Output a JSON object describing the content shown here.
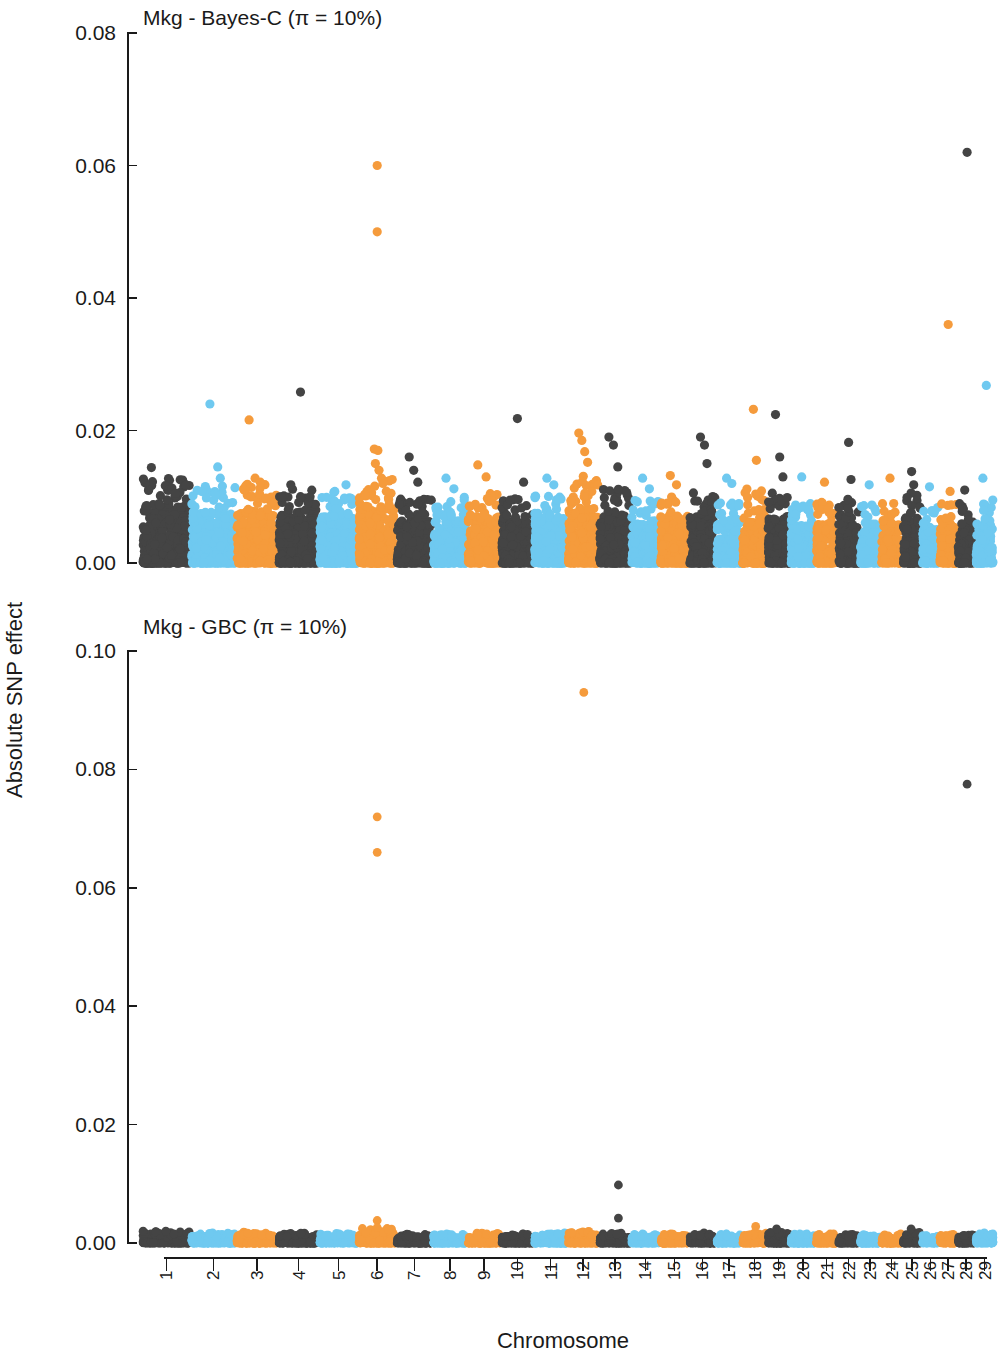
{
  "figure": {
    "width": 999,
    "height": 1357,
    "background": "#ffffff"
  },
  "axes": {
    "x_title": "Chromosome",
    "y_title": "Absolute SNP effect"
  },
  "colors": {
    "dark": "#444444",
    "blue": "#6FC9F0",
    "orange": "#F59B3C",
    "axis": "#1a1a1a",
    "background": "#ffffff"
  },
  "chart_data": [
    {
      "type": "scatter",
      "panel": "top",
      "title": "Mkg - Bayes-C (π = 10%)",
      "xlabel": "Chromosome",
      "ylabel": "Absolute SNP effect",
      "ylim": [
        0,
        0.08
      ],
      "yticks": [
        0.0,
        0.02,
        0.04,
        0.06,
        0.08
      ],
      "ytick_labels": [
        "0.00",
        "0.02",
        "0.04",
        "0.06",
        "0.08"
      ],
      "grid": false,
      "legend": "none",
      "categories": [
        "1",
        "2",
        "3",
        "4",
        "5",
        "6",
        "7",
        "8",
        "9",
        "10",
        "11",
        "12",
        "13",
        "14",
        "15",
        "16",
        "17",
        "18",
        "19",
        "20",
        "21",
        "22",
        "23",
        "24",
        "25",
        "26",
        "27",
        "28",
        "29"
      ],
      "chromosome_widths": [
        100,
        93,
        86,
        83,
        80,
        77,
        74,
        70,
        68,
        66,
        68,
        63,
        64,
        58,
        58,
        54,
        51,
        50,
        45,
        50,
        43,
        43,
        41,
        42,
        37,
        33,
        35,
        34,
        36
      ],
      "chromosome_baseline_max": [
        0.0085,
        0.0075,
        0.0078,
        0.0072,
        0.007,
        0.0082,
        0.0065,
        0.0065,
        0.0068,
        0.0063,
        0.0068,
        0.0085,
        0.0072,
        0.0062,
        0.0065,
        0.007,
        0.006,
        0.0072,
        0.0068,
        0.0058,
        0.006,
        0.0062,
        0.0058,
        0.006,
        0.007,
        0.0055,
        0.0058,
        0.0058,
        0.0062
      ],
      "outliers": [
        {
          "chrom": 1,
          "pos": 0.18,
          "value": 0.0144
        },
        {
          "chrom": 1,
          "pos": 0.55,
          "value": 0.011
        },
        {
          "chrom": 1,
          "pos": 0.62,
          "value": 0.0113
        },
        {
          "chrom": 1,
          "pos": 0.7,
          "value": 0.0105
        },
        {
          "chrom": 2,
          "pos": 0.42,
          "value": 0.024
        },
        {
          "chrom": 2,
          "pos": 0.6,
          "value": 0.0145
        },
        {
          "chrom": 2,
          "pos": 0.66,
          "value": 0.0128
        },
        {
          "chrom": 3,
          "pos": 0.3,
          "value": 0.0216
        },
        {
          "chrom": 3,
          "pos": 0.45,
          "value": 0.0128
        },
        {
          "chrom": 3,
          "pos": 0.58,
          "value": 0.0122
        },
        {
          "chrom": 3,
          "pos": 0.72,
          "value": 0.0098
        },
        {
          "chrom": 4,
          "pos": 0.3,
          "value": 0.0118
        },
        {
          "chrom": 4,
          "pos": 0.55,
          "value": 0.0258
        },
        {
          "chrom": 4,
          "pos": 0.8,
          "value": 0.01
        },
        {
          "chrom": 5,
          "pos": 0.4,
          "value": 0.0108
        },
        {
          "chrom": 5,
          "pos": 0.7,
          "value": 0.0118
        },
        {
          "chrom": 6,
          "pos": 0.5,
          "value": 0.06
        },
        {
          "chrom": 6,
          "pos": 0.5,
          "value": 0.05
        },
        {
          "chrom": 6,
          "pos": 0.42,
          "value": 0.0172
        },
        {
          "chrom": 6,
          "pos": 0.52,
          "value": 0.017
        },
        {
          "chrom": 6,
          "pos": 0.45,
          "value": 0.015
        },
        {
          "chrom": 6,
          "pos": 0.55,
          "value": 0.014
        },
        {
          "chrom": 6,
          "pos": 0.62,
          "value": 0.0128
        },
        {
          "chrom": 6,
          "pos": 0.66,
          "value": 0.012
        },
        {
          "chrom": 7,
          "pos": 0.35,
          "value": 0.016
        },
        {
          "chrom": 7,
          "pos": 0.48,
          "value": 0.014
        },
        {
          "chrom": 7,
          "pos": 0.6,
          "value": 0.0122
        },
        {
          "chrom": 8,
          "pos": 0.38,
          "value": 0.0128
        },
        {
          "chrom": 8,
          "pos": 0.62,
          "value": 0.0112
        },
        {
          "chrom": 9,
          "pos": 0.3,
          "value": 0.0148
        },
        {
          "chrom": 9,
          "pos": 0.56,
          "value": 0.013
        },
        {
          "chrom": 10,
          "pos": 0.5,
          "value": 0.0218
        },
        {
          "chrom": 10,
          "pos": 0.7,
          "value": 0.0122
        },
        {
          "chrom": 11,
          "pos": 0.38,
          "value": 0.0128
        },
        {
          "chrom": 11,
          "pos": 0.6,
          "value": 0.0118
        },
        {
          "chrom": 12,
          "pos": 0.35,
          "value": 0.0196
        },
        {
          "chrom": 12,
          "pos": 0.45,
          "value": 0.0185
        },
        {
          "chrom": 12,
          "pos": 0.55,
          "value": 0.0168
        },
        {
          "chrom": 12,
          "pos": 0.65,
          "value": 0.0152
        },
        {
          "chrom": 13,
          "pos": 0.3,
          "value": 0.019
        },
        {
          "chrom": 13,
          "pos": 0.45,
          "value": 0.0178
        },
        {
          "chrom": 13,
          "pos": 0.6,
          "value": 0.0145
        },
        {
          "chrom": 14,
          "pos": 0.4,
          "value": 0.0128
        },
        {
          "chrom": 14,
          "pos": 0.65,
          "value": 0.0112
        },
        {
          "chrom": 15,
          "pos": 0.35,
          "value": 0.0132
        },
        {
          "chrom": 15,
          "pos": 0.58,
          "value": 0.0118
        },
        {
          "chrom": 16,
          "pos": 0.42,
          "value": 0.019
        },
        {
          "chrom": 16,
          "pos": 0.58,
          "value": 0.0178
        },
        {
          "chrom": 16,
          "pos": 0.68,
          "value": 0.015
        },
        {
          "chrom": 17,
          "pos": 0.4,
          "value": 0.0128
        },
        {
          "chrom": 17,
          "pos": 0.62,
          "value": 0.012
        },
        {
          "chrom": 18,
          "pos": 0.45,
          "value": 0.0232
        },
        {
          "chrom": 18,
          "pos": 0.58,
          "value": 0.0155
        },
        {
          "chrom": 19,
          "pos": 0.35,
          "value": 0.0224
        },
        {
          "chrom": 19,
          "pos": 0.55,
          "value": 0.016
        },
        {
          "chrom": 19,
          "pos": 0.7,
          "value": 0.013
        },
        {
          "chrom": 20,
          "pos": 0.45,
          "value": 0.013
        },
        {
          "chrom": 21,
          "pos": 0.4,
          "value": 0.0122
        },
        {
          "chrom": 22,
          "pos": 0.5,
          "value": 0.0182
        },
        {
          "chrom": 22,
          "pos": 0.62,
          "value": 0.0126
        },
        {
          "chrom": 23,
          "pos": 0.45,
          "value": 0.0118
        },
        {
          "chrom": 24,
          "pos": 0.42,
          "value": 0.0128
        },
        {
          "chrom": 25,
          "pos": 0.48,
          "value": 0.0138
        },
        {
          "chrom": 25,
          "pos": 0.6,
          "value": 0.0118
        },
        {
          "chrom": 26,
          "pos": 0.45,
          "value": 0.0115
        },
        {
          "chrom": 27,
          "pos": 0.5,
          "value": 0.036
        },
        {
          "chrom": 27,
          "pos": 0.62,
          "value": 0.0108
        },
        {
          "chrom": 28,
          "pos": 0.55,
          "value": 0.062
        },
        {
          "chrom": 28,
          "pos": 0.4,
          "value": 0.011
        },
        {
          "chrom": 29,
          "pos": 0.6,
          "value": 0.0268
        },
        {
          "chrom": 29,
          "pos": 0.4,
          "value": 0.0128
        }
      ]
    },
    {
      "type": "scatter",
      "panel": "bottom",
      "title": "Mkg - GBC (π = 10%)",
      "xlabel": "Chromosome",
      "ylabel": "Absolute SNP effect",
      "ylim": [
        0,
        0.1
      ],
      "yticks": [
        0.0,
        0.02,
        0.04,
        0.06,
        0.08,
        0.1
      ],
      "ytick_labels": [
        "0.00",
        "0.02",
        "0.04",
        "0.06",
        "0.08",
        "0.10"
      ],
      "grid": false,
      "legend": "none",
      "categories": [
        "1",
        "2",
        "3",
        "4",
        "5",
        "6",
        "7",
        "8",
        "9",
        "10",
        "11",
        "12",
        "13",
        "14",
        "15",
        "16",
        "17",
        "18",
        "19",
        "20",
        "21",
        "22",
        "23",
        "24",
        "25",
        "26",
        "27",
        "28",
        "29"
      ],
      "chromosome_widths": [
        100,
        93,
        86,
        83,
        80,
        77,
        74,
        70,
        68,
        66,
        68,
        63,
        64,
        58,
        58,
        54,
        51,
        50,
        45,
        50,
        43,
        43,
        41,
        42,
        37,
        33,
        35,
        34,
        36
      ],
      "chromosome_baseline_max": [
        0.0013,
        0.0011,
        0.0012,
        0.0011,
        0.0011,
        0.0016,
        0.001,
        0.001,
        0.0011,
        0.001,
        0.0011,
        0.0013,
        0.0011,
        0.001,
        0.001,
        0.0011,
        0.001,
        0.0012,
        0.0013,
        0.001,
        0.001,
        0.001,
        0.001,
        0.001,
        0.0012,
        0.0009,
        0.001,
        0.001,
        0.0011
      ],
      "outliers": [
        {
          "chrom": 6,
          "pos": 0.5,
          "value": 0.072
        },
        {
          "chrom": 6,
          "pos": 0.5,
          "value": 0.066
        },
        {
          "chrom": 6,
          "pos": 0.5,
          "value": 0.0038
        },
        {
          "chrom": 6,
          "pos": 0.5,
          "value": 0.0026
        },
        {
          "chrom": 12,
          "pos": 0.52,
          "value": 0.093
        },
        {
          "chrom": 13,
          "pos": 0.62,
          "value": 0.0098
        },
        {
          "chrom": 13,
          "pos": 0.62,
          "value": 0.0042
        },
        {
          "chrom": 18,
          "pos": 0.55,
          "value": 0.0028
        },
        {
          "chrom": 19,
          "pos": 0.4,
          "value": 0.0024
        },
        {
          "chrom": 25,
          "pos": 0.45,
          "value": 0.0024
        },
        {
          "chrom": 28,
          "pos": 0.55,
          "value": 0.0775
        }
      ]
    }
  ]
}
